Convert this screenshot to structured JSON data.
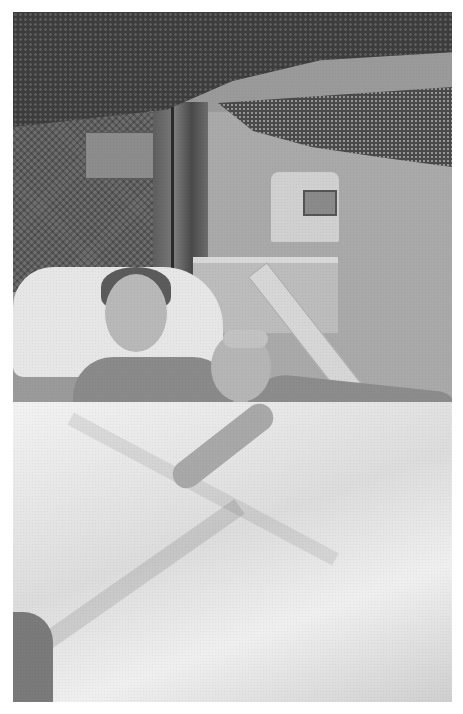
{
  "image": {
    "type": "photograph",
    "color_mode": "grayscale",
    "border_color": "#ffffff",
    "description": "Two people resting together in a hospital bed under a netting canopy, with a wall-mounted monitor and bedside table in the background."
  },
  "scene": {
    "elements": [
      "netting-canopy",
      "curtain",
      "wall-panel",
      "monitor",
      "nightstand",
      "pillow",
      "bed-rail",
      "bed-sheet",
      "adult-patient",
      "child"
    ]
  },
  "colors": {
    "dark_netting": "#3d3d3d",
    "wall": "#a9a9a9",
    "sheet": "#eeeeee"
  }
}
